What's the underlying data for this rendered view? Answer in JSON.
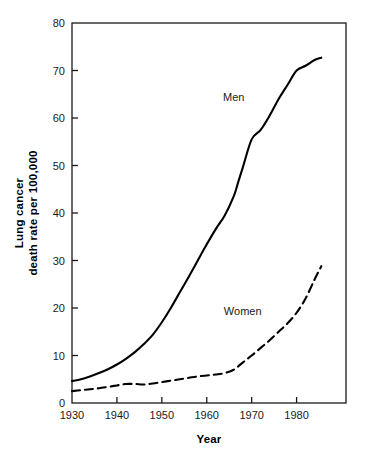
{
  "chart_data": {
    "type": "line",
    "title": "",
    "xlabel": "Year",
    "ylabel": "Lung cancer death rate per 100,000",
    "ylabel_line1": "Lung cancer",
    "ylabel_line2": "death rate per 100,000",
    "xlim": [
      1930,
      1991
    ],
    "ylim": [
      0,
      80
    ],
    "xticks": [
      1930,
      1940,
      1950,
      1960,
      1970,
      1980
    ],
    "xtick_labels": [
      "1930",
      "1940",
      "1950",
      "1960",
      "1970",
      "1980"
    ],
    "yticks": [
      0,
      10,
      20,
      30,
      40,
      50,
      60,
      70,
      80
    ],
    "ytick_labels": [
      "0",
      "10",
      "20",
      "30",
      "40",
      "50",
      "60",
      "70",
      "80"
    ],
    "grid": false,
    "legend_position": "inline-annotations",
    "line_color": "#000000",
    "background_color": "#ffffff",
    "series": [
      {
        "name": "Men",
        "style": "solid",
        "label_x": 1966,
        "label_y": 63.5,
        "x": [
          1930,
          1932,
          1934,
          1936,
          1938,
          1940,
          1942,
          1944,
          1946,
          1948,
          1950,
          1952,
          1954,
          1956,
          1958,
          1960,
          1962,
          1964,
          1966,
          1967,
          1968,
          1970,
          1972,
          1974,
          1976,
          1978,
          1980,
          1982,
          1984,
          1985.5
        ],
        "values": [
          4.6,
          5.0,
          5.6,
          6.3,
          7.1,
          8.1,
          9.3,
          10.7,
          12.4,
          14.4,
          17.0,
          20.0,
          23.3,
          26.6,
          30.0,
          33.4,
          36.6,
          39.5,
          43.5,
          46.5,
          49.5,
          55.5,
          57.5,
          60.5,
          64.0,
          67.0,
          70.0,
          71.0,
          72.2,
          72.7
        ]
      },
      {
        "name": "Women",
        "style": "dashed",
        "label_x": 1968,
        "label_y": 18.5,
        "x": [
          1930,
          1932,
          1934,
          1936,
          1938,
          1940,
          1942,
          1944,
          1946,
          1948,
          1950,
          1952,
          1954,
          1956,
          1958,
          1960,
          1962,
          1964,
          1966,
          1968,
          1970,
          1972,
          1974,
          1976,
          1978,
          1980,
          1982,
          1984,
          1985.5
        ],
        "values": [
          2.5,
          2.7,
          2.9,
          3.1,
          3.4,
          3.7,
          4.0,
          4.0,
          3.9,
          4.1,
          4.4,
          4.7,
          5.0,
          5.3,
          5.6,
          5.8,
          6.0,
          6.3,
          7.0,
          8.5,
          10.0,
          11.6,
          13.2,
          15.0,
          16.8,
          19.0,
          22.0,
          26.0,
          28.8
        ]
      }
    ]
  },
  "plot_geometry": {
    "left": 72,
    "right": 346,
    "top": 23,
    "bottom": 403
  }
}
